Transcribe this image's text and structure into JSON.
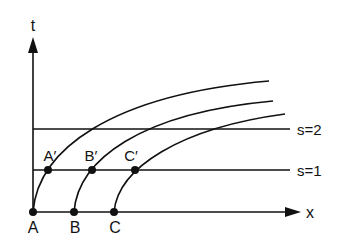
{
  "diagram": {
    "axes": {
      "vertical_label": "t",
      "horizontal_label": "x"
    },
    "levels": [
      {
        "label": "s=2",
        "y": 129
      },
      {
        "label": "s=1",
        "y": 170
      }
    ],
    "base_points": [
      {
        "label": "A",
        "x": 33
      },
      {
        "label": "B",
        "x": 74
      },
      {
        "label": "C",
        "x": 114
      }
    ],
    "intersection_points": [
      {
        "label": "A′",
        "x": 48
      },
      {
        "label": "B′",
        "x": 92
      },
      {
        "label": "C′",
        "x": 135
      }
    ],
    "colors": {
      "stroke": "#111111",
      "background": "#ffffff"
    }
  }
}
